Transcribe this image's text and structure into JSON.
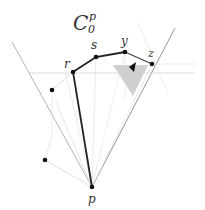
{
  "title": {
    "base": "C",
    "subscript": "0",
    "superscript": "p"
  },
  "points": {
    "p": {
      "label": "p",
      "x": 92,
      "y": 187
    },
    "r": {
      "label": "r",
      "x": 73,
      "y": 72
    },
    "s": {
      "label": "s",
      "x": 96,
      "y": 57
    },
    "y": {
      "label": "y",
      "x": 125,
      "y": 52
    },
    "z": {
      "label": "z",
      "x": 152,
      "y": 64
    },
    "q1": {
      "label": "",
      "x": 52,
      "y": 90
    },
    "q2": {
      "label": "",
      "x": 45,
      "y": 160
    }
  },
  "colors": {
    "path": "#222222",
    "cone_line": "#9a9a9a",
    "faint_line": "#d8d8d8",
    "triangle_fill": "#cfcfcf",
    "label": "#333333"
  }
}
